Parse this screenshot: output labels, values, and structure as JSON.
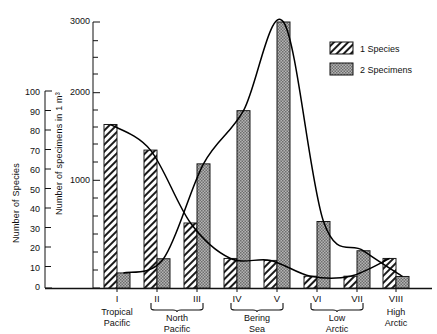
{
  "chart_data": {
    "type": "bar",
    "title": "",
    "subtitle": "",
    "categories": [
      "I",
      "II",
      "III",
      "IV",
      "V",
      "VI",
      "VII",
      "VIII"
    ],
    "regions": [
      {
        "label": "Tropical\nPacific",
        "spans": [
          "I"
        ],
        "bracket": false
      },
      {
        "label": "North\nPacific",
        "spans": [
          "II",
          "III"
        ],
        "bracket": true
      },
      {
        "label": "Bering\nSea",
        "spans": [
          "IV",
          "V"
        ],
        "bracket": true
      },
      {
        "label": "Low\nArctic",
        "spans": [
          "VI",
          "VII"
        ],
        "bracket": true
      },
      {
        "label": "High\nArctic",
        "spans": [
          "VIII"
        ],
        "bracket": false
      }
    ],
    "series": [
      {
        "name": "1 Species",
        "key": "species",
        "axis": "left",
        "pattern": "diagonal-hatch",
        "values": [
          83,
          70,
          33,
          15,
          14,
          6,
          6,
          15
        ]
      },
      {
        "name": "2 Specimens",
        "key": "specimens",
        "axis": "right",
        "pattern": "gray-stipple",
        "values": [
          170,
          330,
          1400,
          2000,
          3000,
          750,
          420,
          130
        ]
      }
    ],
    "curves": [
      {
        "name": "species-curve",
        "follows": "1 Species",
        "values": [
          83,
          70,
          33,
          15,
          14,
          6,
          6,
          15
        ]
      },
      {
        "name": "specimens-curve",
        "follows": "2 Specimens",
        "values": [
          170,
          330,
          1400,
          2000,
          3000,
          750,
          420,
          130
        ]
      }
    ],
    "axes": {
      "left": {
        "label": "Number of Species",
        "ticks": [
          0,
          10,
          20,
          30,
          40,
          50,
          60,
          70,
          80,
          90,
          100
        ],
        "ylim": [
          0,
          100
        ]
      },
      "inner": {
        "label": "Number of specimens in 1 m³",
        "ticks_labeled": [
          1000,
          2000,
          3000
        ],
        "ticks_minor_step": 100,
        "ylim": [
          0,
          3000
        ]
      },
      "x": {
        "label": ""
      }
    },
    "grid": false,
    "legend": {
      "position": "top-right",
      "entries": [
        {
          "label": "1 Species",
          "swatch": "diagonal-hatch"
        },
        {
          "label": "2 Specimens",
          "swatch": "gray-stipple"
        }
      ]
    },
    "colors": {
      "axis": "#111111",
      "hatch_fill": "#ffffff",
      "hatch_line": "#1a1a1a",
      "gray_fill": "#a6a6a6",
      "gray_edge": "#1a1a1a",
      "curve": "#000000",
      "background": "#ffffff"
    }
  }
}
